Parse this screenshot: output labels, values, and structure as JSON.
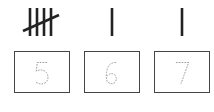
{
  "tallies": [
    {
      "count": 5,
      "label": "tally-five"
    },
    {
      "count": 1,
      "label": "tally-one"
    },
    {
      "count": 1,
      "label": "tally-one"
    }
  ],
  "boxes": [
    {
      "digit": "5",
      "style": "dotted-trace"
    },
    {
      "digit": "6",
      "style": "dotted-trace"
    },
    {
      "digit": "7",
      "style": "dotted-trace"
    }
  ],
  "colors": {
    "stroke": "#222222",
    "box_border": "#444444",
    "dots": "#999999",
    "background": "#ffffff"
  }
}
